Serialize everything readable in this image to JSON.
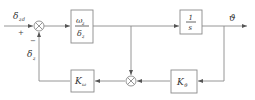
{
  "diagram": {
    "type": "control-block-diagram",
    "input": {
      "symbol": "δ",
      "subscript": "zd",
      "sign": "+"
    },
    "feedback_signal": {
      "symbol": "δ",
      "subscript": "z",
      "sign": "−"
    },
    "blocks": [
      {
        "id": "forward-gain",
        "numerator": "ω",
        "numerator_sub": "z",
        "denominator": "δ",
        "denominator_sub": "z"
      },
      {
        "id": "integrator",
        "numerator": "1",
        "denominator": "s"
      },
      {
        "id": "k-theta",
        "symbol": "K",
        "subscript": "ϑ"
      },
      {
        "id": "k-omega",
        "symbol": "K",
        "subscript": "ω"
      }
    ],
    "output": {
      "symbol": "ϑ"
    },
    "junctions": [
      {
        "id": "summing-junction",
        "glyph": "⊗"
      },
      {
        "id": "multiplier-junction",
        "glyph": "⊗"
      }
    ],
    "colors": {
      "line": "#8a8a8a",
      "box_border": "#8a8a8a",
      "text": "#333333"
    }
  }
}
